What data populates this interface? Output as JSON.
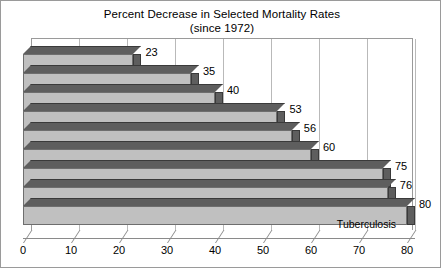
{
  "chart_data": {
    "type": "bar",
    "orientation": "horizontal",
    "title": "Percent Decrease in Selected Mortality Rates",
    "subtitle": "(since 1972)",
    "categories": [
      "Suicide",
      "Alcoholism",
      "Homicide",
      "Pneumonia/Influenza",
      "Accidents",
      "Infant Deaths",
      "Maternal Deaths",
      "GI Diseases",
      "Tuberculosis"
    ],
    "values": [
      23,
      35,
      40,
      53,
      56,
      60,
      75,
      76,
      80
    ],
    "value_labels": [
      "23",
      "35",
      "40",
      "53",
      "56",
      "60",
      "75",
      "76",
      "80"
    ],
    "xlabel": "",
    "ylabel": "",
    "xlim": [
      0,
      80
    ],
    "xticks": [
      "0",
      "10",
      "20",
      "30",
      "40",
      "50",
      "60",
      "70",
      "80"
    ],
    "grid": true,
    "legend": false,
    "style": "3d",
    "colors": {
      "bar_face": "#c0c0c0",
      "bar_shadow": "#5e5e5e",
      "outline": "#6e6e6e",
      "gridline": "#b9b9b9",
      "axis": "#8a8a8a",
      "background": "#ffffff",
      "text": "#000000"
    }
  }
}
